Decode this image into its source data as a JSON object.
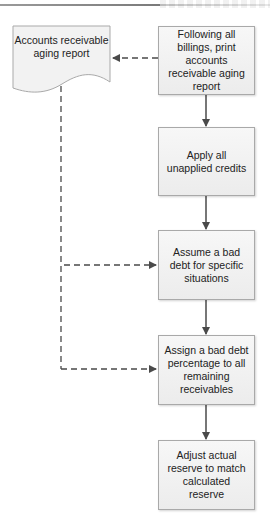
{
  "diagram": {
    "type": "flowchart",
    "document": {
      "label": "Accounts receivable aging report",
      "shape": "document"
    },
    "steps": [
      {
        "id": "step1",
        "label": "Following all billings, print accounts receivable aging report"
      },
      {
        "id": "step2",
        "label": "Apply all unapplied credits"
      },
      {
        "id": "step3",
        "label": "Assume a bad debt for specific situations"
      },
      {
        "id": "step4",
        "label": "Assign a bad debt percentage to all remaining receivables"
      },
      {
        "id": "step5",
        "label": "Adjust actual reserve to match calculated reserve"
      }
    ],
    "connectors": [
      {
        "from": "step1",
        "to": "document",
        "style": "dashed"
      },
      {
        "from": "step1",
        "to": "step2",
        "style": "solid"
      },
      {
        "from": "step2",
        "to": "step3",
        "style": "solid"
      },
      {
        "from": "step3",
        "to": "step4",
        "style": "solid"
      },
      {
        "from": "step4",
        "to": "step5",
        "style": "solid"
      },
      {
        "from": "document",
        "to": "step3",
        "style": "dashed"
      },
      {
        "from": "document",
        "to": "step4",
        "style": "dashed"
      }
    ],
    "colors": {
      "box_fill": "#f2f2f2",
      "box_border": "#a9a9a9",
      "connector": "#4a4a4a",
      "text": "#222222"
    }
  }
}
